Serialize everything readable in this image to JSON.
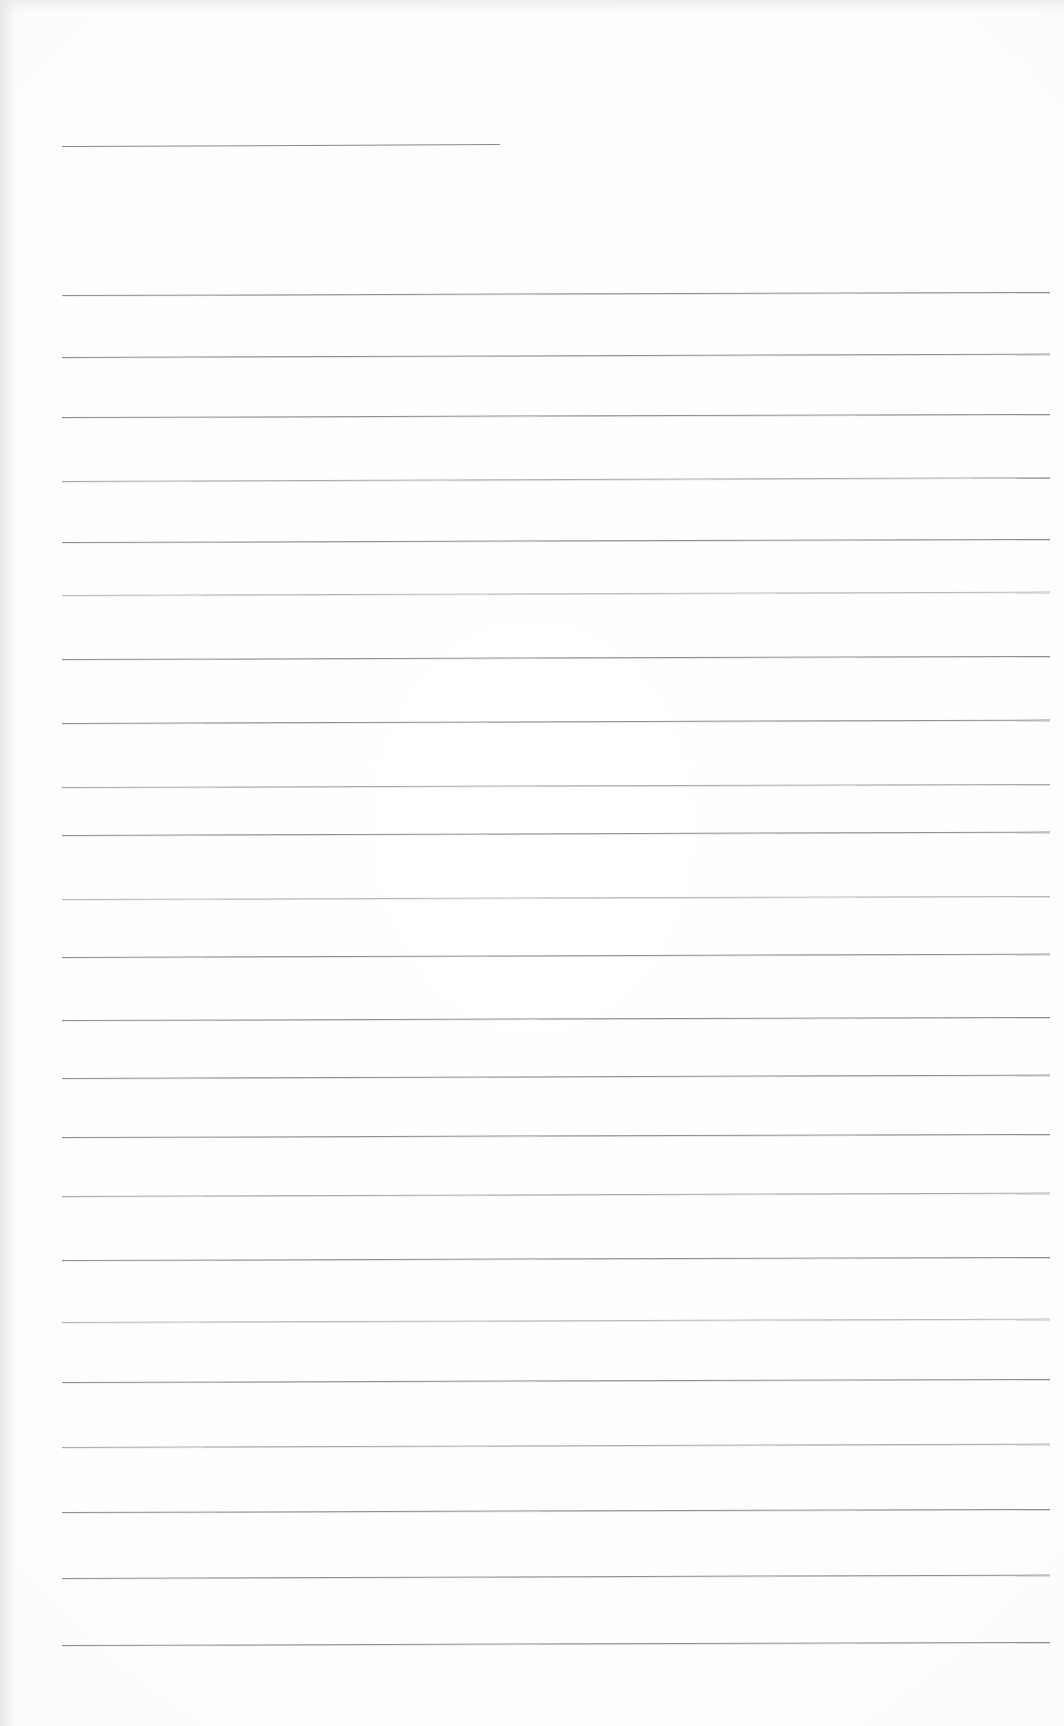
{
  "document": {
    "kind": "scanned-ruled-paper",
    "title": "",
    "visible_text": "",
    "page_width": 1064,
    "page_height": 1726,
    "background_color": "#fdfdfd",
    "rule_color": "#8d8f93",
    "content_note": "blank"
  },
  "header_rule": {
    "x": 62,
    "y": 146,
    "width": 438,
    "tilt_deg": -0.25,
    "weight": "normal"
  },
  "ruled_lines": [
    {
      "x": 62,
      "y": 295,
      "width": 988,
      "tilt_deg": -0.18,
      "weight": "normal"
    },
    {
      "x": 62,
      "y": 357,
      "width": 988,
      "tilt_deg": -0.2,
      "weight": "normal"
    },
    {
      "x": 62,
      "y": 417,
      "width": 988,
      "tilt_deg": -0.18,
      "weight": "normal"
    },
    {
      "x": 62,
      "y": 481,
      "width": 988,
      "tilt_deg": -0.22,
      "weight": "faint"
    },
    {
      "x": 62,
      "y": 542,
      "width": 988,
      "tilt_deg": -0.18,
      "weight": "normal"
    },
    {
      "x": 62,
      "y": 595,
      "width": 988,
      "tilt_deg": -0.2,
      "weight": "veryfaint"
    },
    {
      "x": 62,
      "y": 659,
      "width": 988,
      "tilt_deg": -0.18,
      "weight": "normal"
    },
    {
      "x": 62,
      "y": 723,
      "width": 988,
      "tilt_deg": -0.2,
      "weight": "normal"
    },
    {
      "x": 62,
      "y": 787,
      "width": 988,
      "tilt_deg": -0.18,
      "weight": "faint"
    },
    {
      "x": 62,
      "y": 835,
      "width": 988,
      "tilt_deg": -0.2,
      "weight": "normal"
    },
    {
      "x": 62,
      "y": 899,
      "width": 988,
      "tilt_deg": -0.18,
      "weight": "veryfaint"
    },
    {
      "x": 62,
      "y": 957,
      "width": 988,
      "tilt_deg": -0.2,
      "weight": "normal"
    },
    {
      "x": 62,
      "y": 1020,
      "width": 988,
      "tilt_deg": -0.18,
      "weight": "normal"
    },
    {
      "x": 62,
      "y": 1078,
      "width": 988,
      "tilt_deg": -0.2,
      "weight": "normal"
    },
    {
      "x": 62,
      "y": 1137,
      "width": 988,
      "tilt_deg": -0.18,
      "weight": "normal"
    },
    {
      "x": 62,
      "y": 1196,
      "width": 988,
      "tilt_deg": -0.2,
      "weight": "faint"
    },
    {
      "x": 62,
      "y": 1260,
      "width": 988,
      "tilt_deg": -0.18,
      "weight": "normal"
    },
    {
      "x": 62,
      "y": 1322,
      "width": 988,
      "tilt_deg": -0.2,
      "weight": "veryfaint"
    },
    {
      "x": 62,
      "y": 1382,
      "width": 988,
      "tilt_deg": -0.18,
      "weight": "normal"
    },
    {
      "x": 62,
      "y": 1447,
      "width": 988,
      "tilt_deg": -0.2,
      "weight": "faint"
    },
    {
      "x": 62,
      "y": 1512,
      "width": 988,
      "tilt_deg": -0.18,
      "weight": "normal"
    },
    {
      "x": 62,
      "y": 1578,
      "width": 988,
      "tilt_deg": -0.2,
      "weight": "normal"
    },
    {
      "x": 62,
      "y": 1645,
      "width": 988,
      "tilt_deg": -0.18,
      "weight": "normal"
    }
  ]
}
